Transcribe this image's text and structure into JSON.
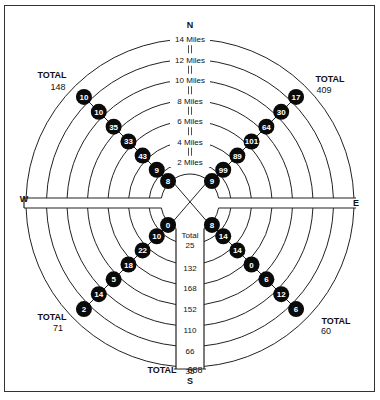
{
  "compass": {
    "north": "N",
    "south": "S",
    "east": "E",
    "west": "W"
  },
  "rings": [
    {
      "miles": 2,
      "label": "2 Miles"
    },
    {
      "miles": 4,
      "label": "4 Miles"
    },
    {
      "miles": 6,
      "label": "6 Miles"
    },
    {
      "miles": 8,
      "label": "8 Miles"
    },
    {
      "miles": 10,
      "label": "10 Miles"
    },
    {
      "miles": 12,
      "label": "12 Miles"
    },
    {
      "miles": 14,
      "label": "14 Miles"
    }
  ],
  "quadrants": {
    "northwest": {
      "total_label": "TOTAL",
      "total": "148",
      "values": [
        "8",
        "9",
        "43",
        "33",
        "35",
        "10",
        "10"
      ]
    },
    "northeast": {
      "total_label": "TOTAL",
      "total": "409",
      "values": [
        "9",
        "99",
        "89",
        "101",
        "64",
        "30",
        "17"
      ]
    },
    "southwest": {
      "total_label": "TOTAL",
      "total": "71",
      "values": [
        "0",
        "10",
        "22",
        "18",
        "5",
        "14",
        "2"
      ]
    },
    "southeast": {
      "total_label": "TOTAL",
      "total": "60",
      "values": [
        "8",
        "14",
        "14",
        "0",
        "6",
        "12",
        "6"
      ]
    }
  },
  "south_column": {
    "center_label": "Total",
    "values": [
      "25",
      "132",
      "168",
      "152",
      "110",
      "66",
      "35"
    ],
    "total_label": "TOTAL",
    "total": "688"
  }
}
